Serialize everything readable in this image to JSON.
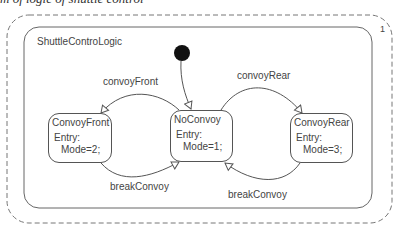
{
  "caption": "m of logic of shuttle control",
  "region": {
    "multiplicity": "1",
    "statemachine_name": "ShuttleControLogic"
  },
  "states": [
    {
      "id": "convoy-front",
      "name": "ConvoyFront",
      "entry_label": "Entry:",
      "action": "Mode=2;"
    },
    {
      "id": "no-convoy",
      "name": "NoConvoy",
      "entry_label": "Entry:",
      "action": "Mode=1;"
    },
    {
      "id": "convoy-rear",
      "name": "ConvoyRear",
      "entry_label": "Entry:",
      "action": "Mode=3;"
    }
  ],
  "transitions": [
    {
      "from": "NoConvoy",
      "to": "ConvoyFront",
      "label": "convoyFront"
    },
    {
      "from": "NoConvoy",
      "to": "ConvoyRear",
      "label": "convoyRear"
    },
    {
      "from": "ConvoyFront",
      "to": "NoConvoy",
      "label": "breakConvoy"
    },
    {
      "from": "ConvoyRear",
      "to": "NoConvoy",
      "label": "breakConvoy"
    },
    {
      "from": "initial",
      "to": "NoConvoy",
      "label": ""
    }
  ]
}
